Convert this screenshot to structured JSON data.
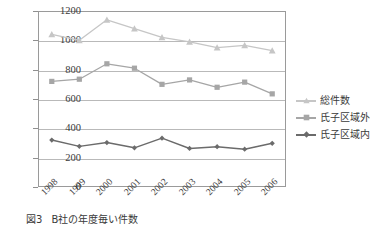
{
  "chart_data": {
    "type": "line",
    "title": "",
    "xlabel": "",
    "ylabel": "",
    "ylim": [
      0,
      1200
    ],
    "ytick_step": 200,
    "yticks": [
      1200,
      1000,
      800,
      600,
      400,
      200,
      0
    ],
    "grid": true,
    "legend_position": "right",
    "categories": [
      "1998",
      "1999",
      "2000",
      "2001",
      "2002",
      "2003",
      "2004",
      "2005",
      "2006"
    ],
    "series": [
      {
        "name": "総件数",
        "marker": "triangle",
        "color": "#c6c6c6",
        "values": [
          1040,
          1000,
          1140,
          1080,
          1020,
          990,
          950,
          965,
          930
        ]
      },
      {
        "name": "氏子区域外",
        "marker": "square",
        "color": "#a6a6a6",
        "values": [
          720,
          735,
          840,
          810,
          700,
          730,
          680,
          715,
          635
        ]
      },
      {
        "name": "氏子区域内",
        "marker": "diamond",
        "color": "#6b6b6b",
        "values": [
          320,
          277,
          303,
          267,
          333,
          263,
          275,
          258,
          298
        ]
      }
    ]
  },
  "caption": {
    "number": "図3",
    "text": "B社の年度毎い件数"
  },
  "colors": {
    "axis": "#9a9a9a",
    "grid": "#b9b9b9",
    "text": "#3a3a3a",
    "series_total": "#c6c6c6",
    "series_outside": "#a6a6a6",
    "series_inside": "#6b6b6b"
  }
}
